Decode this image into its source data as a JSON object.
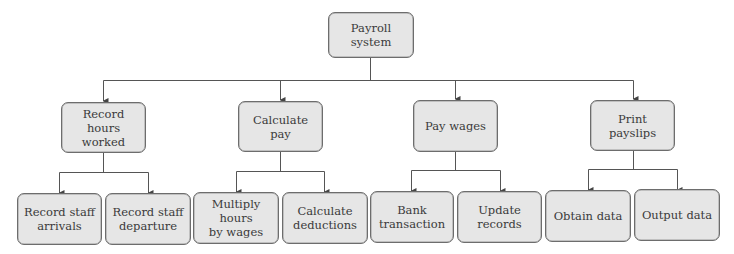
{
  "diagram": {
    "type": "hierarchy-chart",
    "colors": {
      "node_fill": "#e6e6e6",
      "node_border": "#6d6d6d",
      "line": "#555555",
      "text": "#3a3a3a",
      "background": "#ffffff"
    },
    "root": {
      "label": "Payroll system",
      "line1": "Payroll",
      "line2": "system"
    },
    "level2": [
      {
        "label": "Record hours worked",
        "line1": "Record",
        "line2": "hours worked"
      },
      {
        "label": "Calculate pay",
        "line1": "Calculate pay",
        "line2": ""
      },
      {
        "label": "Pay wages",
        "line1": "Pay wages",
        "line2": ""
      },
      {
        "label": "Print payslips",
        "line1": "Print payslips",
        "line2": ""
      }
    ],
    "level3": [
      {
        "parent": "Record hours worked",
        "label": "Record staff arrivals",
        "line1": "Record staff",
        "line2": "arrivals"
      },
      {
        "parent": "Record hours worked",
        "label": "Record staff departure",
        "line1": "Record staff",
        "line2": "departure"
      },
      {
        "parent": "Calculate pay",
        "label": "Multiply hours by wages",
        "line1": "Multiply hours",
        "line2": "by wages"
      },
      {
        "parent": "Calculate pay",
        "label": "Calculate deductions",
        "line1": "Calculate",
        "line2": "deductions"
      },
      {
        "parent": "Pay wages",
        "label": "Bank transaction",
        "line1": "Bank",
        "line2": "transaction"
      },
      {
        "parent": "Pay wages",
        "label": "Update records",
        "line1": "Update",
        "line2": "records"
      },
      {
        "parent": "Print payslips",
        "label": "Obtain data",
        "line1": "Obtain data",
        "line2": ""
      },
      {
        "parent": "Print payslips",
        "label": "Output data",
        "line1": "Output data",
        "line2": ""
      }
    ]
  }
}
